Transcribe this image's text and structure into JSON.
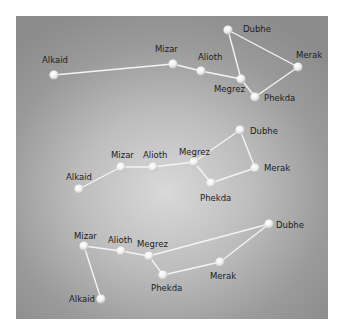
{
  "figure": {
    "background_colors": {
      "center": "#d9d9d9",
      "edge": "#8c8c8c"
    },
    "star_color": "#f2f2f2",
    "line_color": "#f4f4f4"
  },
  "groups": [
    {
      "id": "top",
      "stars": [
        {
          "name": "Alkaid",
          "x": 54,
          "y": 75,
          "lx": 42,
          "ly": 63
        },
        {
          "name": "Mizar",
          "x": 173,
          "y": 64,
          "lx": 155,
          "ly": 52
        },
        {
          "name": "Alioth",
          "x": 201,
          "y": 71,
          "lx": 198,
          "ly": 60
        },
        {
          "name": "Megrez",
          "x": 241,
          "y": 79,
          "lx": 214,
          "ly": 92
        },
        {
          "name": "Dubhe",
          "x": 228,
          "y": 30,
          "lx": 243,
          "ly": 32
        },
        {
          "name": "Merak",
          "x": 298,
          "y": 67,
          "lx": 296,
          "ly": 58
        },
        {
          "name": "Phekda",
          "x": 255,
          "y": 97,
          "lx": 264,
          "ly": 101
        }
      ],
      "links": [
        [
          "Alkaid",
          "Mizar"
        ],
        [
          "Mizar",
          "Alioth"
        ],
        [
          "Alioth",
          "Megrez"
        ],
        [
          "Megrez",
          "Dubhe"
        ],
        [
          "Dubhe",
          "Merak"
        ],
        [
          "Merak",
          "Phekda"
        ],
        [
          "Phekda",
          "Megrez"
        ]
      ]
    },
    {
      "id": "middle",
      "stars": [
        {
          "name": "Alkaid",
          "x": 79,
          "y": 189,
          "lx": 66,
          "ly": 180
        },
        {
          "name": "Mizar",
          "x": 121,
          "y": 167,
          "lx": 111,
          "ly": 158
        },
        {
          "name": "Alioth",
          "x": 153,
          "y": 167,
          "lx": 143,
          "ly": 158
        },
        {
          "name": "Megrez",
          "x": 194,
          "y": 162,
          "lx": 179,
          "ly": 155
        },
        {
          "name": "Dubhe",
          "x": 240,
          "y": 130,
          "lx": 250,
          "ly": 134
        },
        {
          "name": "Merak",
          "x": 255,
          "y": 168,
          "lx": 264,
          "ly": 171
        },
        {
          "name": "Phekda",
          "x": 211,
          "y": 183,
          "lx": 200,
          "ly": 201
        }
      ],
      "links": [
        [
          "Alkaid",
          "Mizar"
        ],
        [
          "Mizar",
          "Alioth"
        ],
        [
          "Alioth",
          "Megrez"
        ],
        [
          "Megrez",
          "Dubhe"
        ],
        [
          "Dubhe",
          "Merak"
        ],
        [
          "Merak",
          "Phekda"
        ],
        [
          "Phekda",
          "Megrez"
        ]
      ]
    },
    {
      "id": "bottom",
      "stars": [
        {
          "name": "Mizar",
          "x": 84,
          "y": 246,
          "lx": 74,
          "ly": 239
        },
        {
          "name": "Alioth",
          "x": 121,
          "y": 251,
          "lx": 108,
          "ly": 243
        },
        {
          "name": "Megrez",
          "x": 149,
          "y": 256,
          "lx": 137,
          "ly": 247
        },
        {
          "name": "Phekda",
          "x": 163,
          "y": 275,
          "lx": 151,
          "ly": 291
        },
        {
          "name": "Merak",
          "x": 220,
          "y": 262,
          "lx": 210,
          "ly": 279
        },
        {
          "name": "Dubhe",
          "x": 269,
          "y": 224,
          "lx": 276,
          "ly": 228
        },
        {
          "name": "Alkaid",
          "x": 101,
          "y": 299,
          "lx": 69,
          "ly": 302
        }
      ],
      "links": [
        [
          "Alkaid",
          "Mizar"
        ],
        [
          "Mizar",
          "Alioth"
        ],
        [
          "Alioth",
          "Megrez"
        ],
        [
          "Megrez",
          "Dubhe"
        ],
        [
          "Dubhe",
          "Merak"
        ],
        [
          "Merak",
          "Phekda"
        ],
        [
          "Phekda",
          "Megrez"
        ]
      ]
    }
  ]
}
